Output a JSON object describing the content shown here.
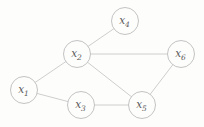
{
  "diagram": {
    "type": "undirected-graph",
    "background_color": "#fdfdfc",
    "node_fill": "#fdfdfc",
    "node_stroke_color": "#bcbcbc",
    "edge_color": "#c2c2c2",
    "label_color": "#5a5a5a",
    "node_radius": 13.5,
    "nodes": [
      {
        "id": "x1",
        "label": "x1",
        "base": "x",
        "sub": "1",
        "cx": 24,
        "cy": 90
      },
      {
        "id": "x2",
        "label": "x2",
        "base": "x",
        "sub": "2",
        "cx": 77,
        "cy": 54
      },
      {
        "id": "x3",
        "label": "x3",
        "base": "x",
        "sub": "3",
        "cx": 81,
        "cy": 105
      },
      {
        "id": "x4",
        "label": "x4",
        "base": "x",
        "sub": "4",
        "cx": 125,
        "cy": 21
      },
      {
        "id": "x5",
        "label": "x5",
        "base": "x",
        "sub": "5",
        "cx": 142,
        "cy": 105
      },
      {
        "id": "x6",
        "label": "x6",
        "base": "x",
        "sub": "6",
        "cx": 181,
        "cy": 54
      }
    ],
    "edges": [
      {
        "from": "x1",
        "to": "x2"
      },
      {
        "from": "x1",
        "to": "x3"
      },
      {
        "from": "x2",
        "to": "x4"
      },
      {
        "from": "x2",
        "to": "x5"
      },
      {
        "from": "x2",
        "to": "x6"
      },
      {
        "from": "x3",
        "to": "x5"
      },
      {
        "from": "x5",
        "to": "x6"
      }
    ]
  }
}
